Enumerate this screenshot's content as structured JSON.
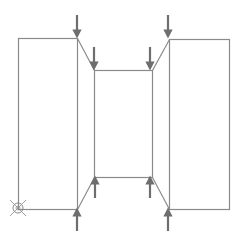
{
  "diagram": {
    "title": "",
    "colors": {
      "background": "#ffffff",
      "outline": "#8a8a8a",
      "arrow": "#6e6e6e",
      "origin_symbol": "#8a8a8a"
    },
    "shapes": {
      "left_block": {
        "x1": 18,
        "y1": 38,
        "x2": 77,
        "y2": 209
      },
      "middle_block": {
        "x1": 94,
        "y1": 70,
        "x2": 152,
        "y2": 177
      },
      "right_block": {
        "x1": 169,
        "y1": 39,
        "x2": 229,
        "y2": 209
      }
    },
    "connectors": [
      {
        "name": "top-left-bevel",
        "x1": 77,
        "y1": 38,
        "x2": 94,
        "y2": 70
      },
      {
        "name": "top-right-bevel",
        "x1": 152,
        "y1": 70,
        "x2": 169,
        "y2": 39
      },
      {
        "name": "bottom-left-bevel",
        "x1": 77,
        "y1": 209,
        "x2": 94,
        "y2": 177
      },
      {
        "name": "bottom-right-bevel",
        "x1": 152,
        "y1": 177,
        "x2": 169,
        "y2": 209
      }
    ],
    "arrows": [
      {
        "name": "arrow-down-outer-left",
        "direction": "down",
        "x": 77,
        "y_start": 15,
        "y_end": 34
      },
      {
        "name": "arrow-down-inner-left",
        "direction": "down",
        "x": 94,
        "y_start": 47,
        "y_end": 66
      },
      {
        "name": "arrow-down-inner-right",
        "direction": "down",
        "x": 150,
        "y_start": 47,
        "y_end": 66
      },
      {
        "name": "arrow-down-outer-right",
        "direction": "down",
        "x": 168,
        "y_start": 15,
        "y_end": 34
      },
      {
        "name": "arrow-up-inner-left",
        "direction": "up",
        "x": 95,
        "y_start": 198,
        "y_end": 180
      },
      {
        "name": "arrow-up-outer-left",
        "direction": "up",
        "x": 77,
        "y_start": 231,
        "y_end": 212
      },
      {
        "name": "arrow-up-inner-right",
        "direction": "up",
        "x": 150,
        "y_start": 198,
        "y_end": 180
      },
      {
        "name": "arrow-up-outer-right",
        "direction": "up",
        "x": 168,
        "y_start": 231,
        "y_end": 212
      }
    ],
    "origin_symbol": {
      "name": "crossed-circle",
      "cx": 18,
      "cy": 208,
      "r": 5
    }
  }
}
